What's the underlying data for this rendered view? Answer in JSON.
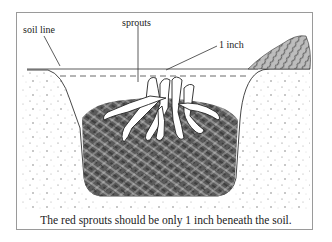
{
  "figure": {
    "labels": {
      "soil_line": "soil line",
      "sprouts": "sprouts",
      "depth": "1 inch"
    },
    "caption": "The red sprouts should be only 1 inch beneath the soil."
  }
}
